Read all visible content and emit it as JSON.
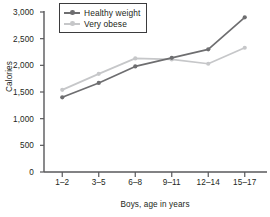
{
  "chart_data": {
    "type": "line",
    "title": "",
    "xlabel": "Boys, age in years",
    "ylabel": "Calories",
    "categories": [
      "1–2",
      "3–5",
      "6–8",
      "9–11",
      "12–14",
      "15–17"
    ],
    "ylim": [
      0,
      3000
    ],
    "yticks": [
      0,
      500,
      1000,
      1500,
      2000,
      2500,
      3000
    ],
    "ytick_labels": [
      "0",
      "500",
      "1,000",
      "1,500",
      "2,000",
      "2,500",
      "3,000"
    ],
    "grid": false,
    "legend_position": "top-left",
    "series": [
      {
        "name": "Healthy weight",
        "color": "#6e6e70",
        "values": [
          1400,
          1670,
          1980,
          2140,
          2300,
          2900
        ]
      },
      {
        "name": "Very obese",
        "color": "#c6c7c9",
        "values": [
          1540,
          1840,
          2130,
          2110,
          2030,
          2330
        ]
      }
    ]
  },
  "legend": {
    "items": [
      {
        "label": "Healthy weight",
        "color": "#6e6e70"
      },
      {
        "label": "Very obese",
        "color": "#c6c7c9"
      }
    ]
  },
  "axis": {
    "line_color": "#58585b",
    "text_color": "#231f20"
  }
}
